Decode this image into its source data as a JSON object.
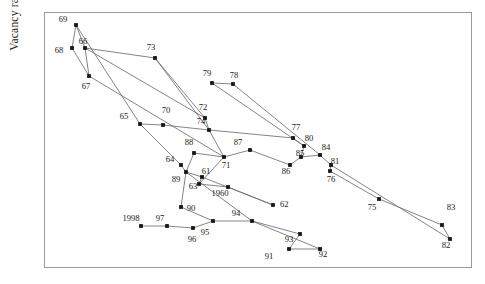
{
  "chart": {
    "title": "",
    "ylabel_text": "Vacancy rate",
    "xlabel_text": "",
    "frame_color": "#9a9a9a",
    "line_color": "#6e6e6e",
    "marker_color": "#161616",
    "background": "#ffffff"
  },
  "chart_data": {
    "type": "scatter",
    "title": "",
    "subtitle": "",
    "xlabel": "",
    "ylabel": "Vacancy rate",
    "grid": false,
    "legend": null,
    "axis_ticks_shown": false,
    "connected": true,
    "note": "Connected scatter / phase diagram: each marker is a year, labelled by its two-digit year (1960 labelled in full). Points are joined in chronological order.",
    "xlim": [
      0,
      1
    ],
    "ylim": [
      0,
      1
    ],
    "series": [
      {
        "name": "trajectory",
        "points": [
          {
            "label": "1960",
            "x": 0.4262,
            "y": 0.2422
          },
          {
            "label": "61",
            "x": 0.4122,
            "y": 0.2695
          },
          {
            "label": "63",
            "x": 0.4075,
            "y": 0.25
          },
          {
            "label": "64",
            "x": 0.3458,
            "y": 0.3867
          },
          {
            "label": "89",
            "x": 0.3668,
            "y": 0.3477
          },
          {
            "label": "65",
            "x": 0.285,
            "y": 0.5273
          },
          {
            "label": "66",
            "x": 0.1355,
            "y": 0.8242
          },
          {
            "label": "67",
            "x": 0.1449,
            "y": 0.7148
          },
          {
            "label": "68",
            "x": 0.1028,
            "y": 0.8242
          },
          {
            "label": "69",
            "x": 0.1121,
            "y": 0.9336
          },
          {
            "label": "70",
            "x": 0.3084,
            "y": 0.5195
          },
          {
            "label": "71",
            "x": 0.4393,
            "y": 0.3945
          },
          {
            "label": "72",
            "x": 0.3879,
            "y": 0.543
          },
          {
            "label": "73",
            "x": 0.2593,
            "y": 0.7852
          },
          {
            "label": "74",
            "x": 0.3949,
            "y": 0.4961
          },
          {
            "label": "75",
            "x": 0.7336,
            "y": 0.2305
          },
          {
            "label": "76",
            "x": 0.6472,
            "y": 0.332
          },
          {
            "label": "77",
            "x": 0.5584,
            "y": 0.4453
          },
          {
            "label": "78",
            "x": 0.486,
            "y": 0.6914
          },
          {
            "label": "79",
            "x": 0.4229,
            "y": 0.7031
          },
          {
            "label": "80",
            "x": 0.5841,
            "y": 0.4063
          },
          {
            "label": "81",
            "x": 0.6449,
            "y": 0.3477
          },
          {
            "label": "82",
            "x": 0.9206,
            "y": 0.1016
          },
          {
            "label": "83",
            "x": 0.9019,
            "y": 0.1445
          },
          {
            "label": "84",
            "x": 0.6168,
            "y": 0.3906
          },
          {
            "label": "85",
            "x": 0.5724,
            "y": 0.3828
          },
          {
            "label": "86",
            "x": 0.5467,
            "y": 0.3516
          },
          {
            "label": "87",
            "x": 0.4533,
            "y": 0.4102
          },
          {
            "label": "88",
            "x": 0.4028,
            "y": 0.4219
          },
          {
            "label": "90",
            "x": 0.3458,
            "y": 0.2109
          },
          {
            "label": "91",
            "x": 0.5327,
            "y": 0.0469
          },
          {
            "label": "92",
            "x": 0.6051,
            "y": 0.0469
          },
          {
            "label": "93",
            "x": 0.5584,
            "y": 0.1055
          },
          {
            "label": "94",
            "x": 0.4463,
            "y": 0.1563
          },
          {
            "label": "95",
            "x": 0.3551,
            "y": 0.1563
          },
          {
            "label": "96",
            "x": 0.3084,
            "y": 0.1289
          },
          {
            "label": "97",
            "x": 0.2477,
            "y": 0.1367
          },
          {
            "label": "62",
            "x": 0.5187,
            "y": 0.2188
          },
          {
            "label": "1998",
            "x": 0.1729,
            "y": 0.1367
          }
        ]
      }
    ]
  },
  "points": [
    {
      "id": "p1960",
      "label": "1960",
      "px": 228,
      "py": 187,
      "lx": 220,
      "ly": 196,
      "anchor": "middle"
    },
    {
      "id": "p61",
      "label": "61",
      "px": 202,
      "py": 177,
      "lx": 206,
      "ly": 174,
      "anchor": "middle"
    },
    {
      "id": "p63",
      "label": "63",
      "px": 199,
      "py": 184,
      "lx": 193,
      "ly": 189,
      "anchor": "middle"
    },
    {
      "id": "p64",
      "label": "64",
      "px": 181,
      "py": 165,
      "lx": 170,
      "ly": 162,
      "anchor": "middle"
    },
    {
      "id": "p89",
      "label": "89",
      "px": 186,
      "py": 172,
      "lx": 176,
      "ly": 182,
      "anchor": "middle"
    },
    {
      "id": "p65",
      "label": "65",
      "px": 140,
      "py": 124,
      "lx": 124,
      "ly": 119,
      "anchor": "middle"
    },
    {
      "id": "p66",
      "label": "66",
      "px": 85,
      "py": 48,
      "lx": 83,
      "ly": 44,
      "anchor": "middle"
    },
    {
      "id": "p67",
      "label": "67",
      "px": 89,
      "py": 76,
      "lx": 86,
      "ly": 89,
      "anchor": "middle"
    },
    {
      "id": "p68",
      "label": "68",
      "px": 72,
      "py": 48,
      "lx": 59,
      "ly": 53,
      "anchor": "middle"
    },
    {
      "id": "p69",
      "label": "69",
      "px": 76,
      "py": 25,
      "lx": 63,
      "ly": 22,
      "anchor": "middle"
    },
    {
      "id": "p70",
      "label": "70",
      "px": 163,
      "py": 125,
      "lx": 166,
      "ly": 113,
      "anchor": "middle"
    },
    {
      "id": "p71",
      "label": "71",
      "px": 224,
      "py": 157,
      "lx": 226,
      "ly": 168,
      "anchor": "middle"
    },
    {
      "id": "p72",
      "label": "72",
      "px": 205,
      "py": 118,
      "lx": 203,
      "ly": 110,
      "anchor": "middle"
    },
    {
      "id": "p73",
      "label": "73",
      "px": 155,
      "py": 58,
      "lx": 151,
      "ly": 50,
      "anchor": "middle"
    },
    {
      "id": "p74",
      "label": "74",
      "px": 209,
      "py": 130,
      "lx": 201,
      "ly": 124,
      "anchor": "middle"
    },
    {
      "id": "p75",
      "label": "75",
      "px": 379,
      "py": 199,
      "lx": 372,
      "ly": 210,
      "anchor": "middle"
    },
    {
      "id": "p76",
      "label": "76",
      "px": 330,
      "py": 171,
      "lx": 331,
      "ly": 182,
      "anchor": "middle"
    },
    {
      "id": "p77",
      "label": "77",
      "px": 293,
      "py": 138,
      "lx": 296,
      "ly": 130,
      "anchor": "middle"
    },
    {
      "id": "p78",
      "label": "78",
      "px": 233,
      "py": 84,
      "lx": 234,
      "ly": 78,
      "anchor": "middle"
    },
    {
      "id": "p79",
      "label": "79",
      "px": 212,
      "py": 83,
      "lx": 207,
      "ly": 76,
      "anchor": "middle"
    },
    {
      "id": "p80",
      "label": "80",
      "px": 304,
      "py": 146,
      "lx": 309,
      "ly": 141,
      "anchor": "middle"
    },
    {
      "id": "p81",
      "label": "81",
      "px": 331,
      "py": 165,
      "lx": 335,
      "ly": 164,
      "anchor": "middle"
    },
    {
      "id": "p82",
      "label": "82",
      "px": 450,
      "py": 239,
      "lx": 446,
      "ly": 248,
      "anchor": "middle"
    },
    {
      "id": "p83",
      "label": "83",
      "px": 442,
      "py": 225,
      "lx": 451,
      "ly": 210,
      "anchor": "middle"
    },
    {
      "id": "p84",
      "label": "84",
      "px": 320,
      "py": 155,
      "lx": 326,
      "ly": 150,
      "anchor": "middle"
    },
    {
      "id": "p85",
      "label": "85",
      "px": 301,
      "py": 157,
      "lx": 300,
      "ly": 156,
      "anchor": "middle"
    },
    {
      "id": "p86",
      "label": "86",
      "px": 290,
      "py": 165,
      "lx": 286,
      "ly": 174,
      "anchor": "middle"
    },
    {
      "id": "p87",
      "label": "87",
      "px": 250,
      "py": 150,
      "lx": 238,
      "ly": 145,
      "anchor": "middle"
    },
    {
      "id": "p88",
      "label": "88",
      "px": 194,
      "py": 153,
      "lx": 189,
      "ly": 145,
      "anchor": "middle"
    },
    {
      "id": "p90",
      "label": "90",
      "px": 181,
      "py": 207,
      "lx": 191,
      "ly": 211,
      "anchor": "middle"
    },
    {
      "id": "p91",
      "label": "91",
      "px": 289,
      "py": 249,
      "lx": 269,
      "ly": 259,
      "anchor": "middle"
    },
    {
      "id": "p92",
      "label": "92",
      "px": 320,
      "py": 249,
      "lx": 323,
      "ly": 257,
      "anchor": "middle"
    },
    {
      "id": "p93",
      "label": "93",
      "px": 300,
      "py": 234,
      "lx": 289,
      "ly": 242,
      "anchor": "middle"
    },
    {
      "id": "p94",
      "label": "94",
      "px": 252,
      "py": 221,
      "lx": 236,
      "ly": 216,
      "anchor": "middle"
    },
    {
      "id": "p95",
      "label": "95",
      "px": 213,
      "py": 221,
      "lx": 205,
      "ly": 235,
      "anchor": "middle"
    },
    {
      "id": "p96",
      "label": "96",
      "px": 193,
      "py": 228,
      "lx": 192,
      "ly": 242,
      "anchor": "middle"
    },
    {
      "id": "p97",
      "label": "97",
      "px": 167,
      "py": 226,
      "lx": 160,
      "ly": 221,
      "anchor": "middle"
    },
    {
      "id": "p62",
      "label": "62",
      "px": 273,
      "py": 205,
      "lx": 280,
      "ly": 207,
      "anchor": "start"
    },
    {
      "id": "p1998",
      "label": "1998",
      "px": 141,
      "py": 226,
      "lx": 131,
      "ly": 221,
      "anchor": "middle"
    }
  ],
  "segments": [
    "M141,226 L167,226 L193,228 L213,221 L181,207",
    "M213,221 L252,221 L300,234 L289,249 L320,249 L252,221",
    "M181,207 L186,172",
    "M186,172 L181,165 L140,124 L76,25",
    "M76,25 L72,48 L89,76 L85,48 L76,25",
    "M85,48 L155,58",
    "M85,48 L205,118",
    "M89,76 L224,157",
    "M155,58 L209,130",
    "M155,58 L205,118",
    "M205,118 L209,130",
    "M209,130 L163,125 L140,124",
    "M209,130 L224,157",
    "M224,157 L194,153 L186,172",
    "M224,157 L250,150 L290,165",
    "M212,83 L233,84",
    "M212,83 L304,146",
    "M233,84 L320,155",
    "M293,138 L304,146 L301,157 L320,155 L331,165 L330,171",
    "M290,165 L301,157",
    "M293,138 L209,130",
    "M330,171 L379,199 L442,225 L450,239",
    "M331,165 L450,239",
    "M186,172 L202,177 L199,184 L228,187",
    "M228,187 L273,205",
    "M202,177 L273,205",
    "M199,184 L224,157",
    "M186,172 L252,221"
  ]
}
